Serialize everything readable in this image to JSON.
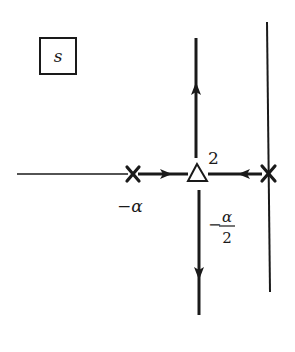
{
  "diagram": {
    "type": "root-locus",
    "plane_label": "s",
    "labels": {
      "pole_left": "−α",
      "breakaway_multiplicity": "2",
      "breakaway_value_minus": "−",
      "breakaway_value_num": "α",
      "breakaway_value_den": "2"
    },
    "points": [
      {
        "kind": "pole",
        "symbol": "x",
        "value": "-alpha"
      },
      {
        "kind": "double-zero/breakaway",
        "symbol": "triangle",
        "value": "-alpha/2",
        "multiplicity": 2
      },
      {
        "kind": "pole",
        "symbol": "x",
        "value": "0"
      }
    ],
    "colors": {
      "ink": "#1a1a1a",
      "background": "#ffffff"
    }
  }
}
